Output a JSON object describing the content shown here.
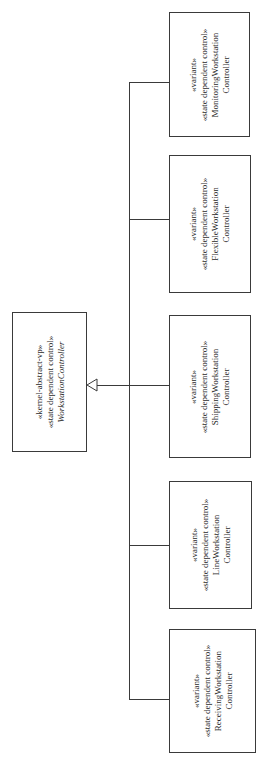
{
  "diagram": {
    "type": "UML class diagram (generalization hierarchy, rotated)",
    "parent": {
      "stereotype1": "«kernel-abstract-vp»",
      "stereotype2": "«state dependent control»",
      "name": "WorkstationController"
    },
    "children": [
      {
        "stereotype1": "«variant»",
        "stereotype2": "«state dependent control»",
        "name_line1": "MonitoringWorkstation",
        "name_line2": "Controller"
      },
      {
        "stereotype1": "«variant»",
        "stereotype2": "«state dependent control»",
        "name_line1": "FlexibleWorkstation",
        "name_line2": "Controller"
      },
      {
        "stereotype1": "«variant»",
        "stereotype2": "«state dependent control»",
        "name_line1": "ShippingWorkstation",
        "name_line2": "Controller"
      },
      {
        "stereotype1": "«variant»",
        "stereotype2": "«state dependent control»",
        "name_line1": "LineWorkstation",
        "name_line2": "Controller"
      },
      {
        "stereotype1": "«variant»",
        "stereotype2": "«state dependent control»",
        "name_line1": "ReceivingWorkstation",
        "name_line2": "Controller"
      }
    ],
    "colors": {
      "line": "#3a3a3a",
      "background": "#ffffff"
    }
  }
}
